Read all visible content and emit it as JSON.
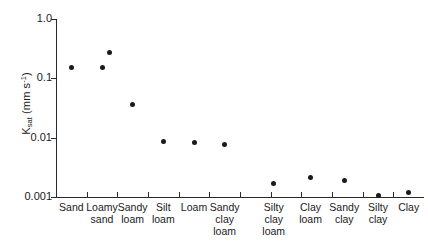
{
  "chart_data": {
    "type": "scatter",
    "title": "",
    "xlabel": "",
    "ylabel": "Ksat (mm s-1)",
    "ylabel_parts": {
      "base": "K",
      "subscript": "sat",
      "unit_open": " (mm s",
      "superscript": "-1",
      "unit_close": ")"
    },
    "yscale": "log",
    "ylim": [
      0.001,
      1.0
    ],
    "ytick_labels": [
      "1.0",
      "0.1",
      "0.01",
      "0.001"
    ],
    "ytick_values": [
      1.0,
      0.1,
      0.01,
      0.001
    ],
    "grid": false,
    "legend": "none",
    "categories": [
      "Sand",
      "Loamy sand",
      "Sandy loam",
      "Silt loam",
      "Loam",
      "Sandy clay loam",
      "Silty clay loam",
      "Clay loam",
      "Sandy clay",
      "Silty clay",
      "Clay"
    ],
    "category_label_lines": [
      [
        "Sand"
      ],
      [
        "Loamy",
        "sand"
      ],
      [
        "Sandy",
        "loam"
      ],
      [
        "Silt",
        "loam"
      ],
      [
        "Loam"
      ],
      [
        "Sandy",
        "clay",
        "loam"
      ],
      [
        "Silty",
        "clay",
        "loam"
      ],
      [
        "Clay",
        "loam"
      ],
      [
        "Sandy",
        "clay"
      ],
      [
        "Silty",
        "clay"
      ],
      [
        "Clay"
      ]
    ],
    "points": [
      {
        "category": "Sand",
        "x_index": 0,
        "value": 0.155
      },
      {
        "category": "Loamy sand",
        "x_index": 1,
        "value": 0.15
      },
      {
        "category": "Loamy sand",
        "x_index": 1,
        "value": 0.27,
        "x_offset": 7
      },
      {
        "category": "Sandy loam",
        "x_index": 2,
        "value": 0.036
      },
      {
        "category": "Silt loam",
        "x_index": 3,
        "value": 0.0085
      },
      {
        "category": "Loam",
        "x_index": 4,
        "value": 0.0082
      },
      {
        "category": "Sandy clay loam",
        "x_index": 5,
        "value": 0.0076
      },
      {
        "category": "Silty clay loam",
        "x_index": 6,
        "value": 0.0017
      },
      {
        "category": "Clay loam",
        "x_index": 7,
        "value": 0.0021
      },
      {
        "category": "Sandy clay",
        "x_index": 8,
        "value": 0.0019
      },
      {
        "category": "Silty clay",
        "x_index": 9,
        "value": 0.00104
      },
      {
        "category": "Clay",
        "x_index": 10,
        "value": 0.00118
      }
    ],
    "marker": {
      "shape": "circle",
      "color": "#1a1a1a",
      "size_px": 5
    },
    "axis_color": "#2a2a2a",
    "background_color": "#ffffff"
  }
}
